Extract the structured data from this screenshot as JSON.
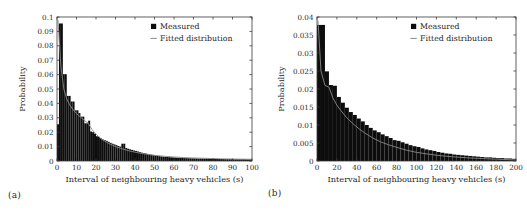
{
  "figure": {
    "panels": [
      {
        "id": "a",
        "sublabel": "(a)",
        "legend": {
          "measured_label": "Measured",
          "fitted_label": "Fitted distribution",
          "measured_marker": "filled-square-marker",
          "fitted_marker": "line-marker"
        },
        "chart_data": {
          "type": "bar",
          "title": "",
          "xlabel": "Interval of neighbouring heavy vehicles (s)",
          "ylabel": "Probability",
          "xlim": [
            0,
            100
          ],
          "ylim": [
            0,
            0.1
          ],
          "xticks": [
            0,
            10,
            20,
            30,
            40,
            50,
            60,
            70,
            80,
            90,
            100
          ],
          "xticklabels": [
            "0",
            "10",
            "20",
            "30",
            "40",
            "50",
            "60",
            "70",
            "80",
            "90",
            "100"
          ],
          "yticks": [
            0,
            0.01,
            0.02,
            0.03,
            0.04,
            0.05,
            0.06,
            0.07,
            0.08,
            0.09,
            0.1
          ],
          "yticklabels": [
            "0",
            "0.01",
            "0.02",
            "0.03",
            "0.04",
            "0.05",
            "0.06",
            "0.07",
            "0.08",
            "0.09",
            "0.1"
          ],
          "grid": false,
          "legend_position": "upper-right",
          "bin_width": 1,
          "bin_starts": [
            0,
            1,
            2,
            3,
            4,
            5,
            6,
            7,
            8,
            9,
            10,
            11,
            12,
            13,
            14,
            15,
            16,
            17,
            18,
            19,
            20,
            21,
            22,
            23,
            24,
            25,
            26,
            27,
            28,
            29,
            30,
            31,
            32,
            33,
            34,
            35,
            36,
            37,
            38,
            39,
            40,
            41,
            42,
            43,
            44,
            45,
            46,
            47,
            48,
            49,
            50,
            51,
            52,
            53,
            54,
            55,
            56,
            57,
            58,
            59,
            60,
            61,
            62,
            63,
            64,
            65,
            66,
            67,
            68,
            69,
            70,
            71,
            72,
            73,
            74,
            75,
            76,
            77,
            78,
            79,
            80,
            81,
            82,
            83,
            84,
            85,
            86,
            87,
            88,
            89,
            90,
            91,
            92,
            93,
            94,
            95,
            96,
            97,
            98,
            99
          ],
          "series": [
            {
              "name": "Measured",
              "kind": "histogram",
              "values": [
                0.0255,
                0.0955,
                0.0955,
                0.0603,
                0.0603,
                0.0452,
                0.0452,
                0.0413,
                0.0413,
                0.0352,
                0.0352,
                0.0333,
                0.0308,
                0.0308,
                0.0262,
                0.0262,
                0.028,
                0.0205,
                0.02,
                0.019,
                0.0172,
                0.0168,
                0.0158,
                0.015,
                0.0145,
                0.014,
                0.0133,
                0.0126,
                0.012,
                0.0115,
                0.011,
                0.0104,
                0.01,
                0.012,
                0.012,
                0.009,
                0.0085,
                0.0081,
                0.0077,
                0.0073,
                0.007,
                0.0066,
                0.0062,
                0.0058,
                0.0055,
                0.0052,
                0.0049,
                0.0046,
                0.0043,
                0.004,
                0.0038,
                0.0036,
                0.0034,
                0.0032,
                0.003,
                0.0029,
                0.0028,
                0.0027,
                0.0026,
                0.0025,
                0.0024,
                0.0023,
                0.0022,
                0.0021,
                0.0021,
                0.002,
                0.002,
                0.0019,
                0.0019,
                0.0018,
                0.0018,
                0.0018,
                0.0017,
                0.0017,
                0.0017,
                0.0016,
                0.0016,
                0.0016,
                0.0015,
                0.0015,
                0.0015,
                0.0015,
                0.0014,
                0.0014,
                0.0014,
                0.0014,
                0.0013,
                0.0013,
                0.0013,
                0.0013,
                0.0013,
                0.0012,
                0.0012,
                0.0012,
                0.0012,
                0.0012,
                0.0012,
                0.0011,
                0.0011,
                0.0011
              ]
            },
            {
              "name": "Fitted distribution",
              "kind": "line",
              "x": [
                0.5,
                2,
                3.5,
                5,
                6.5,
                8,
                10,
                12,
                14,
                16,
                18,
                20,
                23,
                26,
                30,
                34,
                38,
                42,
                46,
                50,
                55,
                60,
                65,
                70,
                75,
                80,
                85,
                90,
                95,
                100
              ],
              "y": [
                0.098,
                0.066,
                0.05,
                0.043,
                0.039,
                0.036,
                0.033,
                0.0305,
                0.0282,
                0.0262,
                0.0218,
                0.0186,
                0.015,
                0.0126,
                0.01,
                0.0082,
                0.0067,
                0.0056,
                0.0047,
                0.004,
                0.0033,
                0.0028,
                0.0024,
                0.0021,
                0.0019,
                0.0017,
                0.0015,
                0.0014,
                0.0013,
                0.0012
              ]
            }
          ]
        }
      },
      {
        "id": "b",
        "sublabel": "(b)",
        "legend": {
          "measured_label": "Measured",
          "fitted_label": "Fitted distribution",
          "measured_marker": "filled-square-marker",
          "fitted_marker": "line-marker"
        },
        "chart_data": {
          "type": "bar",
          "title": "",
          "xlabel": "Interval of neighbouring heavy vehicles (s)",
          "ylabel": "Probability",
          "xlim": [
            0,
            200
          ],
          "ylim": [
            0,
            0.04
          ],
          "xticks": [
            0,
            20,
            40,
            60,
            80,
            100,
            120,
            140,
            160,
            180,
            200
          ],
          "xticklabels": [
            "0",
            "20",
            "40",
            "60",
            "80",
            "100",
            "120",
            "140",
            "160",
            "180",
            "200"
          ],
          "yticks": [
            0,
            0.005,
            0.01,
            0.015,
            0.02,
            0.025,
            0.03,
            0.035,
            0.04
          ],
          "yticklabels": [
            "0",
            "0.005",
            "0.01",
            "0.015",
            "0.02",
            "0.025",
            "0.03",
            "0.035",
            "0.04"
          ],
          "grid": false,
          "legend_position": "upper-right",
          "bin_width": 4,
          "bin_starts": [
            0,
            4,
            8,
            12,
            16,
            20,
            24,
            28,
            32,
            36,
            40,
            44,
            48,
            52,
            56,
            60,
            64,
            68,
            72,
            76,
            80,
            84,
            88,
            92,
            96,
            100,
            104,
            108,
            112,
            116,
            120,
            124,
            128,
            132,
            136,
            140,
            144,
            148,
            152,
            156,
            160,
            164,
            168,
            172,
            176,
            180,
            184,
            188,
            192,
            196
          ],
          "series": [
            {
              "name": "Measured",
              "kind": "histogram",
              "values": [
                0.0378,
                0.0378,
                0.0249,
                0.0211,
                0.0209,
                0.0178,
                0.0162,
                0.0148,
                0.0136,
                0.0128,
                0.0118,
                0.011,
                0.01,
                0.0092,
                0.0085,
                0.008,
                0.0074,
                0.0069,
                0.0064,
                0.0058,
                0.0056,
                0.0052,
                0.0048,
                0.0044,
                0.0041,
                0.0039,
                0.0035,
                0.0032,
                0.003,
                0.0028,
                0.0025,
                0.0023,
                0.0021,
                0.002,
                0.0018,
                0.0017,
                0.0016,
                0.0015,
                0.0014,
                0.0013,
                0.0012,
                0.0011,
                0.001,
                0.001,
                0.0009,
                0.0008,
                0.0008,
                0.0007,
                0.0007,
                0.0006
              ]
            },
            {
              "name": "Fitted distribution",
              "kind": "line",
              "x": [
                1,
                4,
                8,
                12,
                16,
                20,
                24,
                30,
                36,
                42,
                48,
                56,
                64,
                72,
                80,
                90,
                100,
                110,
                120,
                135,
                150,
                165,
                180,
                200
              ],
              "y": [
                0.039,
                0.025,
                0.021,
                0.0205,
                0.0175,
                0.0155,
                0.014,
                0.012,
                0.0104,
                0.009,
                0.0078,
                0.0064,
                0.0053,
                0.0045,
                0.0038,
                0.003,
                0.0024,
                0.002,
                0.0016,
                0.0012,
                0.0009,
                0.0007,
                0.0005,
                0.0003
              ]
            }
          ]
        }
      }
    ]
  }
}
